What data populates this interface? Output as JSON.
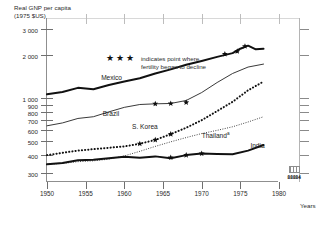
{
  "chart_data": {
    "type": "line",
    "title": "Real GNP per capita (1975 $US)",
    "ylabel_line1": "Real GNP per capita",
    "ylabel_line2": "(1975 $US)",
    "xlabel": "Years",
    "yscale": "log",
    "ylim": [
      260,
      3600
    ],
    "xlim": [
      1950,
      1980
    ],
    "grid": false,
    "legend_position": "inside-top-left",
    "ytick_labels": [
      "3 000",
      "2 000",
      "1 000",
      "900",
      "800",
      "700",
      "600",
      "500",
      "400",
      "300"
    ],
    "ytick_values": [
      3000,
      2000,
      1000,
      900,
      800,
      700,
      600,
      500,
      400,
      300
    ],
    "xtick_labels": [
      "1950",
      "1955",
      "1960",
      "1965",
      "1970",
      "1975",
      "1980"
    ],
    "xtick_values": [
      1950,
      1955,
      1960,
      1965,
      1970,
      1975,
      1980
    ],
    "annotation_stars": "★★★",
    "annotation_text": "indicates point where\nfertility began to decline",
    "series": [
      {
        "name": "Mexico",
        "label": "Mexico",
        "style": "thick-solid",
        "x": [
          1950,
          1952,
          1954,
          1956,
          1958,
          1960,
          1962,
          1964,
          1966,
          1968,
          1970,
          1972,
          1974,
          1975,
          1976,
          1977,
          1978
        ],
        "values": [
          1060,
          1100,
          1175,
          1150,
          1230,
          1300,
          1370,
          1480,
          1580,
          1700,
          1810,
          1930,
          2050,
          2200,
          2310,
          2180,
          2200
        ]
      },
      {
        "name": "Brazil",
        "label": "Brazil",
        "style": "thin-solid",
        "x": [
          1950,
          1952,
          1954,
          1956,
          1958,
          1960,
          1962,
          1964,
          1966,
          1968,
          1970,
          1972,
          1974,
          1976,
          1978
        ],
        "values": [
          640,
          670,
          720,
          740,
          800,
          860,
          900,
          910,
          915,
          960,
          1090,
          1280,
          1480,
          1640,
          1720
        ],
        "stars_x": [
          1964,
          1966,
          1968
        ],
        "stars_y": [
          910,
          915,
          930
        ]
      },
      {
        "name": "S. Korea",
        "label": "S. Korea",
        "style": "thick-dotted",
        "x": [
          1950,
          1952,
          1954,
          1956,
          1958,
          1960,
          1962,
          1964,
          1966,
          1968,
          1970,
          1972,
          1974,
          1976,
          1978
        ],
        "values": [
          400,
          415,
          430,
          440,
          450,
          460,
          480,
          510,
          560,
          620,
          700,
          810,
          940,
          1130,
          1300
        ],
        "stars_x": [
          1962,
          1964,
          1966
        ],
        "stars_y": [
          480,
          510,
          560
        ]
      },
      {
        "name": "Thailand",
        "label": "Thailand",
        "label_superscript": "a",
        "style": "fine-dotted",
        "x": [
          1950,
          1952,
          1954,
          1956,
          1958,
          1960,
          1962,
          1964,
          1966,
          1968,
          1970,
          1972,
          1974,
          1976,
          1978
        ],
        "values": [
          345,
          350,
          360,
          365,
          375,
          395,
          425,
          460,
          495,
          530,
          565,
          595,
          630,
          680,
          740
        ]
      },
      {
        "name": "India",
        "label": "India",
        "style": "thick-solid",
        "x": [
          1950,
          1952,
          1954,
          1956,
          1958,
          1960,
          1962,
          1964,
          1966,
          1968,
          1970,
          1972,
          1974,
          1976,
          1978
        ],
        "values": [
          345,
          352,
          368,
          372,
          380,
          390,
          383,
          392,
          380,
          400,
          410,
          408,
          405,
          430,
          470
        ],
        "stars_x": [
          1966,
          1968,
          1970
        ],
        "stars_y": [
          385,
          400,
          410
        ]
      }
    ]
  },
  "footer": {
    "logo_text": "88884"
  }
}
